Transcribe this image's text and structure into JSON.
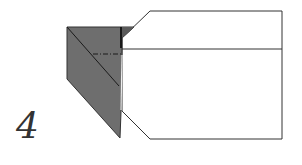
{
  "diagram": {
    "type": "origami-folding-step",
    "step_number": "4",
    "colors": {
      "paper_front": "#ffffff",
      "paper_back": "#6e6e6e",
      "outline": "#333333",
      "fold_line": "#222222"
    },
    "elements": {
      "paper_outline": "white paper body with angled corners on left",
      "colored_flap": "gray folded flap on left side",
      "crease_diagonal": "diagonal crease across gray flap",
      "fold_line_dashdot": "dash-dot valley fold line"
    }
  }
}
